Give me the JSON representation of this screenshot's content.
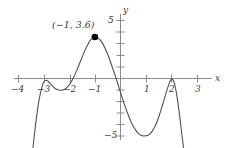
{
  "figure": {
    "title": "",
    "background_color": "#ffffff",
    "curve_color": "#4a4a4a",
    "axis_color": "#8a8a8a",
    "text_color": "#3a3a3a",
    "point_color": "#000000"
  },
  "axes": {
    "x_axis_label": "x",
    "y_axis_label": "y",
    "x_ticks": [
      {
        "value": -4,
        "label": "−4"
      },
      {
        "value": -3,
        "label": "−3"
      },
      {
        "value": -2,
        "label": "−2"
      },
      {
        "value": -1,
        "label": "−1"
      },
      {
        "value": 1,
        "label": "1"
      },
      {
        "value": 2,
        "label": "2"
      },
      {
        "value": 3,
        "label": "3"
      }
    ],
    "y_ticks": [
      {
        "value": 5,
        "label": "5"
      },
      {
        "value": 4,
        "label": ""
      },
      {
        "value": 3,
        "label": ""
      },
      {
        "value": 2,
        "label": ""
      },
      {
        "value": 1,
        "label": ""
      },
      {
        "value": -1,
        "label": ""
      },
      {
        "value": -2,
        "label": ""
      },
      {
        "value": -3,
        "label": ""
      },
      {
        "value": -4,
        "label": ""
      },
      {
        "value": -5,
        "label": "−5"
      }
    ],
    "x_range": [
      -4.35,
      3.3
    ],
    "y_range": [
      -6.6,
      5.9
    ],
    "grid": false
  },
  "annotations": [
    {
      "name": "local-maximum-label",
      "text": "(−1, 3.6)",
      "x": -1,
      "y": 3.6
    }
  ],
  "marked_points": [
    {
      "name": "local-maximum-point",
      "x": -1,
      "y": 3.6,
      "style": "filled-circle"
    }
  ],
  "chart_data": {
    "type": "line",
    "title": "",
    "xlabel": "x",
    "ylabel": "y",
    "xlim": [
      -4.35,
      3.3
    ],
    "ylim": [
      -6.6,
      5.9
    ],
    "grid": false,
    "legend": null,
    "series": [
      {
        "name": "polynomial-curve",
        "color": "#4a4a4a",
        "x": [
          -3.45,
          -3.4,
          -3.35,
          -3.3,
          -3.25,
          -3.2,
          -3.15,
          -3.1,
          -3.05,
          -3.0,
          -2.95,
          -2.9,
          -2.85,
          -2.8,
          -2.75,
          -2.7,
          -2.6,
          -2.5,
          -2.4,
          -2.3,
          -2.2,
          -2.1,
          -2.0,
          -1.9,
          -1.8,
          -1.7,
          -1.6,
          -1.5,
          -1.4,
          -1.3,
          -1.2,
          -1.1,
          -1.0,
          -0.9,
          -0.8,
          -0.7,
          -0.6,
          -0.5,
          -0.4,
          -0.3,
          -0.2,
          -0.1,
          0.0,
          0.1,
          0.2,
          0.3,
          0.4,
          0.5,
          0.6,
          0.7,
          0.8,
          0.9,
          1.0,
          1.05,
          1.1,
          1.2,
          1.3,
          1.4,
          1.5,
          1.6,
          1.7,
          1.8,
          1.9,
          1.95,
          2.0,
          2.05,
          2.1,
          2.15,
          2.2,
          2.25,
          2.3,
          2.35,
          2.4,
          2.45,
          2.5
        ],
        "y": [
          -6.6,
          -5.6,
          -4.6,
          -3.7,
          -2.85,
          -2.1,
          -1.5,
          -1.0,
          -0.6,
          -0.3,
          -0.18,
          -0.15,
          -0.2,
          -0.3,
          -0.42,
          -0.55,
          -0.78,
          -0.93,
          -1.0,
          -1.02,
          -0.95,
          -0.8,
          -0.55,
          -0.2,
          0.25,
          0.75,
          1.3,
          1.85,
          2.4,
          2.85,
          3.25,
          3.5,
          3.6,
          3.55,
          3.35,
          3.05,
          2.6,
          2.1,
          1.5,
          0.85,
          0.2,
          -0.5,
          -1.2,
          -1.9,
          -2.55,
          -3.15,
          -3.7,
          -4.15,
          -4.5,
          -4.78,
          -4.93,
          -4.99,
          -4.97,
          -4.95,
          -4.9,
          -4.7,
          -4.35,
          -3.9,
          -3.3,
          -2.6,
          -1.85,
          -1.1,
          -0.45,
          -0.18,
          -0.05,
          -0.12,
          -0.4,
          -0.85,
          -1.45,
          -2.2,
          -3.05,
          -3.95,
          -4.9,
          -5.8,
          -6.6
        ]
      }
    ],
    "described_features": {
      "local_maximum_labeled": {
        "x": -1,
        "y": 3.6
      },
      "local_maximum_near_minus_3": {
        "x": -2.9,
        "y": -0.15
      },
      "local_minimum_near_minus_2_3": {
        "x": -2.3,
        "y": -1.02
      },
      "local_minimum_near_1": {
        "x": 1.05,
        "y": -5.0
      },
      "local_maximum_near_2": {
        "x": 2.0,
        "y": -0.05
      },
      "x_intercepts_approx": [
        -1.97,
        -0.17,
        1.93
      ]
    }
  }
}
